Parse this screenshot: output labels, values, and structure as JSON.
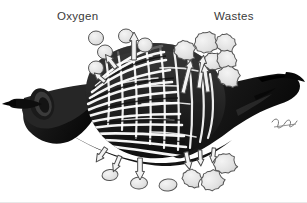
{
  "figure": {
    "name": "gill-gas-exchange-diagram",
    "width": 307,
    "height": 203,
    "background_color": "#ffffff",
    "baseline_rule_color": "#e8e8e8"
  },
  "labels": {
    "oxygen": "Oxygen",
    "wastes": "Wastes",
    "text_color": "#3a3a3a",
    "font_size_px": 11.5
  },
  "palette": {
    "tissue_dark": "#1c1c1c",
    "tissue_mid": "#3b3b3b",
    "tissue_shadow": "#0a0a0a",
    "lamella_gap": "#ffffff",
    "particle_fill": "#e2e2e2",
    "particle_stroke": "#555555",
    "arrow_fill": "#f2f2f2",
    "arrow_stroke": "#4a4a4a",
    "signature_color": "#4a4a4a"
  },
  "structure": {
    "left_tip_label": "afferent vessel tip",
    "left_cut_end_label": "cut vessel end",
    "right_arm_label": "efferent arm",
    "lamellae_mesh_label": "respiratory lamellae mesh",
    "signature_label": "artist signature"
  },
  "oxygen_particles": [
    {
      "cx": 96,
      "cy": 38,
      "rx": 7.5,
      "ry": 7.0,
      "rot": 0
    },
    {
      "cx": 126,
      "cy": 36,
      "rx": 7.5,
      "ry": 7.0,
      "rot": 0
    },
    {
      "cx": 145,
      "cy": 45,
      "rx": 7.5,
      "ry": 7.0,
      "rot": 0
    },
    {
      "cx": 105,
      "cy": 52,
      "rx": 7.5,
      "ry": 7.0,
      "rot": 0
    },
    {
      "cx": 96,
      "cy": 68,
      "rx": 7.5,
      "ry": 7.0,
      "rot": 0
    },
    {
      "cx": 110,
      "cy": 175,
      "rx": 8.0,
      "ry": 5.5,
      "rot": -6
    },
    {
      "cx": 139,
      "cy": 183,
      "rx": 8.5,
      "ry": 6.0,
      "rot": -4
    },
    {
      "cx": 168,
      "cy": 185,
      "rx": 9.0,
      "ry": 6.0,
      "rot": -6
    }
  ],
  "waste_particles": [
    {
      "cx": 185,
      "cy": 50,
      "scale": 1.0,
      "rot": 12
    },
    {
      "cx": 206,
      "cy": 42,
      "scale": 1.1,
      "rot": -18
    },
    {
      "cx": 226,
      "cy": 43,
      "scale": 0.95,
      "rot": 30
    },
    {
      "cx": 213,
      "cy": 61,
      "scale": 0.9,
      "rot": -8
    },
    {
      "cx": 227,
      "cy": 60,
      "scale": 0.98,
      "rot": 55
    },
    {
      "cx": 229,
      "cy": 76,
      "scale": 1.05,
      "rot": 20
    },
    {
      "cx": 225,
      "cy": 163,
      "scale": 1.05,
      "rot": -12
    },
    {
      "cx": 192,
      "cy": 178,
      "scale": 0.9,
      "rot": 24
    },
    {
      "cx": 212,
      "cy": 180,
      "scale": 1.05,
      "rot": -30
    }
  ],
  "arrows": [
    {
      "x": 134,
      "y": 60,
      "len": 28,
      "rot": 0,
      "width": 9,
      "name": "oxygen-out-top-center"
    },
    {
      "x": 116,
      "y": 68,
      "len": 17,
      "rot": -38,
      "width": 8,
      "name": "oxygen-out-top-left"
    },
    {
      "x": 105,
      "y": 82,
      "len": 14,
      "rot": -50,
      "width": 7,
      "name": "oxygen-out-upper-left"
    },
    {
      "x": 183,
      "y": 93,
      "len": 34,
      "rot": 14,
      "width": 8,
      "name": "waste-in-right-a"
    },
    {
      "x": 199,
      "y": 88,
      "len": 33,
      "rot": 8,
      "width": 8,
      "name": "waste-in-right-b"
    },
    {
      "x": 208,
      "y": 92,
      "len": 28,
      "rot": -8,
      "width": 8,
      "name": "waste-in-right-c"
    },
    {
      "x": 106,
      "y": 148,
      "len": 17,
      "rot": -145,
      "width": 8,
      "name": "oxygen-out-bottom-left"
    },
    {
      "x": 120,
      "y": 156,
      "len": 17,
      "rot": -157,
      "width": 8,
      "name": "oxygen-out-bottom-left-b"
    },
    {
      "x": 140,
      "y": 158,
      "len": 22,
      "rot": 180,
      "width": 9,
      "name": "oxygen-out-bottom-center"
    },
    {
      "x": 186,
      "y": 152,
      "len": 18,
      "rot": 168,
      "width": 8,
      "name": "waste-in-bottom-right-a"
    },
    {
      "x": 200,
      "y": 150,
      "len": 16,
      "rot": 177,
      "width": 7,
      "name": "waste-in-bottom-right-b"
    },
    {
      "x": 214,
      "y": 148,
      "len": 15,
      "rot": 186,
      "width": 7,
      "name": "waste-in-bottom-right-c"
    }
  ]
}
